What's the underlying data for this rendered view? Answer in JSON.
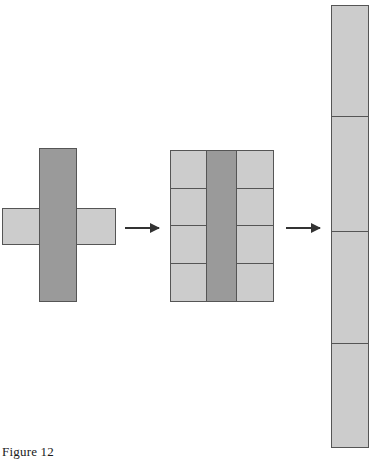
{
  "figure": {
    "caption": "Figure 12",
    "colors": {
      "fill_light": "#cccccc",
      "fill_dark": "#9a9a9a",
      "stroke": "#555555",
      "arrow": "#333333",
      "background": "#ffffff"
    },
    "stages": [
      {
        "name": "cross-shape",
        "description": "plus sign formed by a light horizontal bar crossed by a dark vertical bar",
        "parts": [
          {
            "name": "horizontal-bar",
            "shade": "light"
          },
          {
            "name": "vertical-bar",
            "shade": "dark"
          }
        ]
      },
      {
        "name": "grid-shape",
        "description": "three column block; outer columns each divided into four light cells, center column one tall dark bar",
        "columns": [
          {
            "name": "left-column",
            "shade": "light",
            "cells": 4
          },
          {
            "name": "center-column",
            "shade": "dark",
            "cells": 1
          },
          {
            "name": "right-column",
            "shade": "light",
            "cells": 4
          }
        ]
      },
      {
        "name": "tall-bar-shape",
        "description": "single tall light column divided into four stacked segments",
        "segments": [
          {
            "name": "segment-1",
            "shade": "light"
          },
          {
            "name": "segment-2",
            "shade": "light"
          },
          {
            "name": "segment-3",
            "shade": "light"
          },
          {
            "name": "segment-4",
            "shade": "light"
          }
        ]
      }
    ],
    "arrows": [
      {
        "name": "arrow-cross-to-grid",
        "direction": "right"
      },
      {
        "name": "arrow-grid-to-tall",
        "direction": "right"
      }
    ]
  }
}
